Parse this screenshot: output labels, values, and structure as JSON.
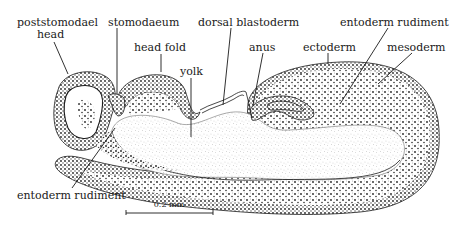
{
  "figure": {
    "type": "anatomical-diagram",
    "labels": [
      {
        "id": "poststomodael-head",
        "lines": [
          "poststomodael",
          "head"
        ]
      },
      {
        "id": "stomodaeum",
        "lines": [
          "stomodaeum"
        ]
      },
      {
        "id": "dorsal-blastoderm",
        "lines": [
          "dorsal blastoderm"
        ]
      },
      {
        "id": "entoderm-rudiment-top",
        "lines": [
          "entoderm rudiment"
        ]
      },
      {
        "id": "head-fold",
        "lines": [
          "head fold"
        ]
      },
      {
        "id": "anus",
        "lines": [
          "anus"
        ]
      },
      {
        "id": "ectoderm",
        "lines": [
          "ectoderm"
        ]
      },
      {
        "id": "mesoderm",
        "lines": [
          "mesoderm"
        ]
      },
      {
        "id": "yolk",
        "lines": [
          "yolk"
        ]
      },
      {
        "id": "entoderm-rudiment-bottom",
        "lines": [
          "entoderm rudiment"
        ]
      }
    ],
    "scale_bar": {
      "label": "0.2 mm"
    },
    "colors": {
      "ink": "#1a1a1a",
      "background": "#ffffff"
    }
  }
}
